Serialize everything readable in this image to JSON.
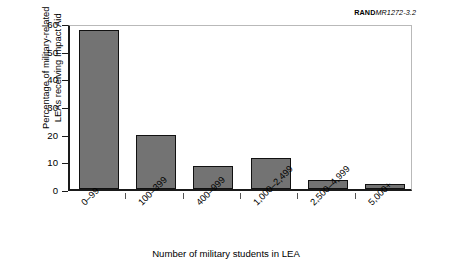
{
  "source_tag": {
    "brand": "RAND",
    "document": "MR1272-3.2"
  },
  "chart_data": {
    "type": "bar",
    "title": "",
    "categories": [
      "0–99",
      "100–399",
      "400–999",
      "1,000–2,499",
      "2,500–4,999",
      "5,000+"
    ],
    "values": [
      57.5,
      19.5,
      8.3,
      11.2,
      3.3,
      1.7
    ],
    "series": [
      {
        "name": "Percentage of military-related LEAs receiving Impact Aid",
        "values": [
          57.5,
          19.5,
          8.3,
          11.2,
          3.3,
          1.7
        ]
      }
    ],
    "xlabel": "Number of military students in LEA",
    "ylabel": "Percentage of military-related LEAs receiving Impact Aid",
    "ylabel_line1": "Percentage of military-related",
    "ylabel_line2": "LEAs receiving Impact Aid",
    "ylim": [
      0,
      60
    ],
    "yticks": [
      0,
      10,
      20,
      30,
      40,
      50,
      60
    ],
    "ytick_labels": [
      "0",
      "10",
      "20",
      "30",
      "40",
      "50",
      "60"
    ],
    "grid": false,
    "legend": "none",
    "bar_color": "#737373",
    "bar_edge_color": "#111111",
    "axis_color": "#1a1a1a",
    "xtick_label_rotation": -45
  }
}
